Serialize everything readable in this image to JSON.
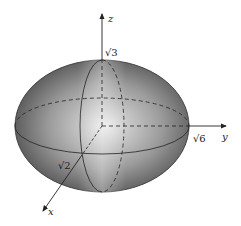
{
  "diagram": {
    "type": "ellipsoid",
    "axes": {
      "x": {
        "label": "x",
        "intercept_label": "√2"
      },
      "y": {
        "label": "y",
        "intercept_label": "√6"
      },
      "z": {
        "label": "z",
        "intercept_label": "√3"
      }
    },
    "colors": {
      "surface_dark": "#4a4a4a",
      "surface_light": "#e6e6e6",
      "line": "#222222"
    }
  }
}
